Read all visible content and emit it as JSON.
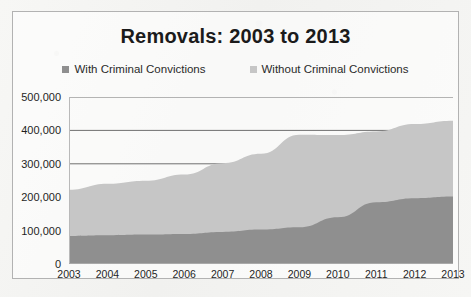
{
  "chart_data": {
    "type": "area",
    "stacked": true,
    "title": "Removals: 2003 to 2013",
    "xlabel": "",
    "ylabel": "",
    "categories": [
      "2003",
      "2004",
      "2005",
      "2006",
      "2007",
      "2008",
      "2009",
      "2010",
      "2011",
      "2012",
      "2013"
    ],
    "series": [
      {
        "name": "With Criminal Convictions",
        "color": "#8f8f8f",
        "values": [
          84000,
          86000,
          88000,
          90000,
          96000,
          103000,
          110000,
          140000,
          185000,
          197000,
          202000
        ]
      },
      {
        "name": "Without Criminal Convictions",
        "color": "#c6c6c6",
        "values": [
          138000,
          154000,
          161000,
          178000,
          206000,
          227000,
          277000,
          246000,
          212000,
          222000,
          227000
        ]
      }
    ],
    "totals": [
      222000,
      240000,
      249000,
      268000,
      302000,
      330000,
      387000,
      386000,
      397000,
      419000,
      429000
    ],
    "ylim": [
      0,
      500000
    ],
    "ytick_labels": [
      "0",
      "100,000",
      "200,000",
      "300,000",
      "400,000",
      "500,000"
    ],
    "ytick_values": [
      0,
      100000,
      200000,
      300000,
      400000,
      500000
    ],
    "grid": true,
    "legend_position": "top",
    "legend": [
      {
        "label": "With Criminal Convictions",
        "color": "#8f8f8f"
      },
      {
        "label": "Without Criminal Convictions",
        "color": "#c6c6c6"
      }
    ]
  }
}
